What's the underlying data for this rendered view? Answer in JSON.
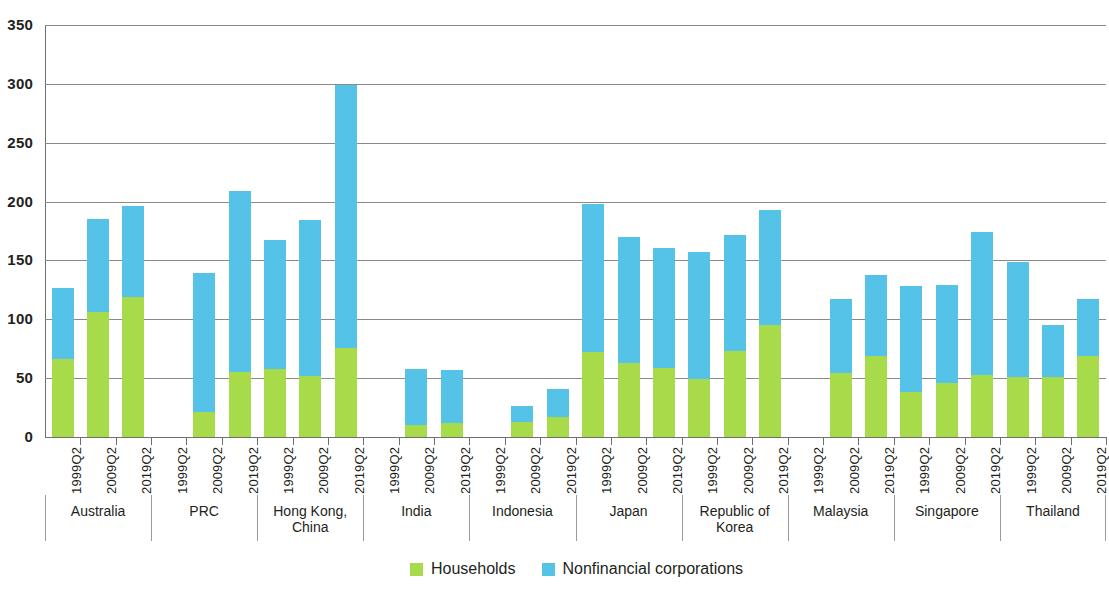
{
  "chart_data": {
    "type": "bar",
    "subtype": "stacked-bar-grouped",
    "title": "",
    "xlabel": "",
    "ylabel": "",
    "ylim": [
      0,
      350
    ],
    "yticks": [
      0,
      50,
      100,
      150,
      200,
      250,
      300,
      350
    ],
    "grid": true,
    "legend_position": "bottom-center",
    "legend": [
      "Households",
      "Nonfinancial corporations"
    ],
    "periods": [
      "1999Q2",
      "2009Q2",
      "2019Q2"
    ],
    "colors": {
      "households": "#a8db4a",
      "nonfinancial_corporations": "#55c3e8",
      "axis": "#6f6f6f",
      "grid": "#8a8a8a",
      "text": "#231f20"
    },
    "categories": [
      "Australia",
      "PRC",
      "Hong Kong, China",
      "India",
      "Indonesia",
      "Japan",
      "Republic of Korea",
      "Malaysia",
      "Singapore",
      "Thailand"
    ],
    "series": [
      {
        "name": "Households",
        "values": [
          [
            66,
            106,
            119
          ],
          [
            null,
            21,
            55
          ],
          [
            58,
            52,
            76
          ],
          [
            null,
            10,
            12
          ],
          [
            null,
            13,
            17
          ],
          [
            72,
            63,
            59
          ],
          [
            49,
            73,
            95
          ],
          [
            null,
            54,
            69
          ],
          [
            38,
            46,
            53
          ],
          [
            51,
            51,
            69
          ]
        ]
      },
      {
        "name": "Nonfinancial corporations",
        "values": [
          [
            61,
            79,
            77
          ],
          [
            null,
            118,
            154
          ],
          [
            109,
            132,
            223
          ],
          [
            null,
            48,
            45
          ],
          [
            null,
            13,
            24
          ],
          [
            126,
            107,
            102
          ],
          [
            108,
            99,
            98
          ],
          [
            null,
            63,
            69
          ],
          [
            90,
            83,
            121
          ],
          [
            98,
            44,
            48
          ]
        ]
      }
    ],
    "totals": [
      [
        127,
        185,
        196
      ],
      [
        null,
        139,
        209
      ],
      [
        167,
        184,
        299
      ],
      [
        null,
        58,
        57
      ],
      [
        null,
        26,
        41
      ],
      [
        198,
        170,
        161
      ],
      [
        157,
        172,
        193
      ],
      [
        null,
        117,
        138
      ],
      [
        128,
        129,
        174
      ],
      [
        149,
        95,
        117
      ]
    ]
  },
  "legend": {
    "items": [
      {
        "label": "Households",
        "swatch": "#a8db4a"
      },
      {
        "label": "Nonfinancial corporations",
        "swatch": "#55c3e8"
      }
    ]
  }
}
